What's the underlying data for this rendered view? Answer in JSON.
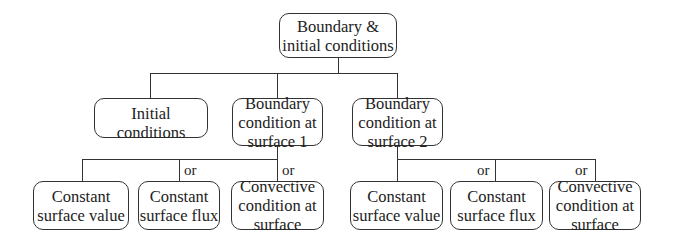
{
  "root": {
    "lines": [
      "Boundary &",
      "initial conditions"
    ]
  },
  "level2": [
    {
      "lines": [
        "Initial conditions"
      ]
    },
    {
      "lines": [
        "Boundary",
        "condition at",
        "surface 1"
      ]
    },
    {
      "lines": [
        "Boundary",
        "condition at",
        "surface 2"
      ]
    }
  ],
  "group1": {
    "children": [
      {
        "lines": [
          "Constant",
          "surface value"
        ]
      },
      {
        "lines": [
          "Constant",
          "surface flux"
        ]
      },
      {
        "lines": [
          "Convective",
          "condition at",
          "surface"
        ]
      }
    ],
    "connectors": [
      "or",
      "or"
    ]
  },
  "group2": {
    "children": [
      {
        "lines": [
          "Constant",
          "surface value"
        ]
      },
      {
        "lines": [
          "Constant",
          "surface flux"
        ]
      },
      {
        "lines": [
          "Convective",
          "condition at",
          "surface"
        ]
      }
    ],
    "connectors": [
      "or",
      "or"
    ]
  }
}
